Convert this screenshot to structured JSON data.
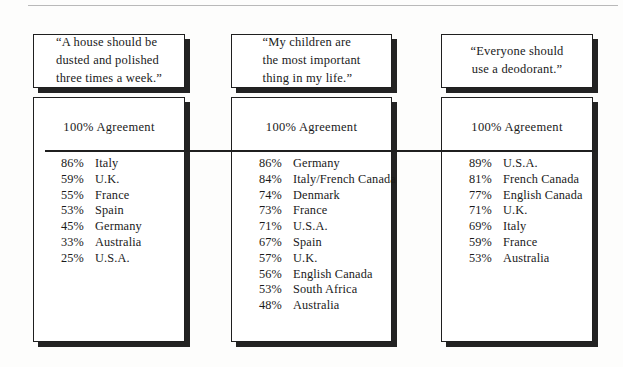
{
  "figure": {
    "columns": [
      {
        "quote": "“A house should be\ndusted and polished\nthree times a week.”",
        "quote_align": "left",
        "agreement_label": "100% Agreement",
        "stats": [
          {
            "percent": "86%",
            "country": "Italy"
          },
          {
            "percent": "59%",
            "country": "U.K."
          },
          {
            "percent": "55%",
            "country": "France"
          },
          {
            "percent": "53%",
            "country": "Spain"
          },
          {
            "percent": "45%",
            "country": "Germany"
          },
          {
            "percent": "33%",
            "country": "Australia"
          },
          {
            "percent": "25%",
            "country": "U.S.A."
          }
        ]
      },
      {
        "quote": "“My children are\nthe most important\nthing in my life.”",
        "quote_align": "left",
        "agreement_label": "100% Agreement",
        "stats": [
          {
            "percent": "86%",
            "country": "Germany"
          },
          {
            "percent": "84%",
            "country": "Italy/French Canada"
          },
          {
            "percent": "74%",
            "country": "Denmark"
          },
          {
            "percent": "73%",
            "country": "France"
          },
          {
            "percent": "71%",
            "country": "U.S.A."
          },
          {
            "percent": "67%",
            "country": "Spain"
          },
          {
            "percent": "57%",
            "country": "U.K."
          },
          {
            "percent": "56%",
            "country": "English Canada"
          },
          {
            "percent": "53%",
            "country": "South Africa"
          },
          {
            "percent": "48%",
            "country": "Australia"
          }
        ]
      },
      {
        "quote": "“Everyone should\nuse a deodorant.”",
        "quote_align": "center",
        "agreement_label": "100% Agreement",
        "stats": [
          {
            "percent": "89%",
            "country": "U.S.A."
          },
          {
            "percent": "81%",
            "country": "French Canada"
          },
          {
            "percent": "77%",
            "country": "English Canada"
          },
          {
            "percent": "71%",
            "country": "U.K."
          },
          {
            "percent": "69%",
            "country": "Italy"
          },
          {
            "percent": "59%",
            "country": "France"
          },
          {
            "percent": "53%",
            "country": "Australia"
          }
        ]
      }
    ]
  }
}
